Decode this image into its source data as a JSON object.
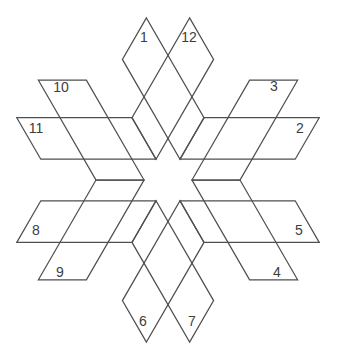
{
  "canvas": {
    "width": 337,
    "height": 357,
    "background": "#ffffff"
  },
  "style": {
    "stroke_color": "#4f4f4f",
    "stroke_width": 1.25,
    "label_color": "#3d3d3d",
    "label_font_size": 14
  },
  "diagram": {
    "type": "interlocking-parallelogram-star",
    "description_center_x": 168,
    "description_center_y": 180,
    "num_shapes": 12
  },
  "shapes": [
    {
      "label": "1",
      "points": [
        [
          146.4,
          17.9
        ],
        [
          122.4,
          59.4
        ],
        [
          180,
          159.2
        ],
        [
          204,
          117.7
        ]
      ],
      "label_pos": [
        144,
        37
      ]
    },
    {
      "label": "2",
      "points": [
        [
          319.2,
          117.7
        ],
        [
          295.2,
          159.2
        ],
        [
          180,
          159.2
        ],
        [
          204,
          117.7
        ]
      ],
      "label_pos": [
        300,
        128
      ]
    },
    {
      "label": "3",
      "points": [
        [
          297.6,
          80.2
        ],
        [
          249.6,
          80.2
        ],
        [
          192,
          180
        ],
        [
          240,
          180
        ]
      ],
      "label_pos": [
        274,
        86
      ]
    },
    {
      "label": "4",
      "points": [
        [
          297.6,
          279.8
        ],
        [
          249.6,
          279.8
        ],
        [
          192,
          180
        ],
        [
          240,
          180
        ]
      ],
      "label_pos": [
        277,
        272
      ]
    },
    {
      "label": "5",
      "points": [
        [
          319.2,
          242.4
        ],
        [
          295.2,
          200.8
        ],
        [
          180,
          200.8
        ],
        [
          204,
          242.4
        ]
      ],
      "label_pos": [
        299,
        230
      ]
    },
    {
      "label": "6",
      "points": [
        [
          146.4,
          342.1
        ],
        [
          122.4,
          300.6
        ],
        [
          180,
          200.8
        ],
        [
          204,
          242.4
        ]
      ],
      "label_pos": [
        143,
        321
      ]
    },
    {
      "label": "7",
      "points": [
        [
          189.6,
          342.1
        ],
        [
          213.6,
          300.6
        ],
        [
          156,
          200.8
        ],
        [
          132,
          242.4
        ]
      ],
      "label_pos": [
        192,
        321
      ]
    },
    {
      "label": "8",
      "points": [
        [
          16.8,
          242.4
        ],
        [
          40.8,
          200.8
        ],
        [
          156,
          200.8
        ],
        [
          132,
          242.4
        ]
      ],
      "label_pos": [
        36,
        230
      ]
    },
    {
      "label": "9",
      "points": [
        [
          38.4,
          279.8
        ],
        [
          86.4,
          279.8
        ],
        [
          144,
          180
        ],
        [
          96,
          180
        ]
      ],
      "label_pos": [
        60,
        272
      ]
    },
    {
      "label": "10",
      "points": [
        [
          38.4,
          80.2
        ],
        [
          86.4,
          80.2
        ],
        [
          144,
          180
        ],
        [
          96,
          180
        ]
      ],
      "label_pos": [
        61,
        87
      ]
    },
    {
      "label": "11",
      "points": [
        [
          16.8,
          117.7
        ],
        [
          40.8,
          159.2
        ],
        [
          156,
          159.2
        ],
        [
          132,
          117.7
        ]
      ],
      "label_pos": [
        36,
        128
      ]
    },
    {
      "label": "12",
      "points": [
        [
          189.6,
          17.9
        ],
        [
          213.6,
          59.4
        ],
        [
          156,
          159.2
        ],
        [
          132,
          117.7
        ]
      ],
      "label_pos": [
        189,
        37
      ]
    }
  ]
}
